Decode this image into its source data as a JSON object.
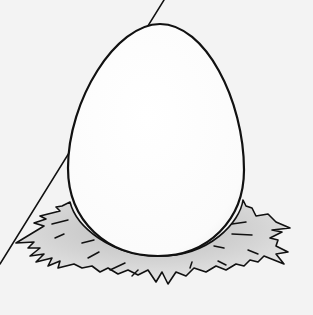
{
  "image": {
    "subject": "Illustration of a white egg resting on a straw nest",
    "background_color": "#f3f3f3",
    "egg_color": "#ffffff",
    "nest_color": "#d6d6d6",
    "outline_color": "#111111"
  }
}
